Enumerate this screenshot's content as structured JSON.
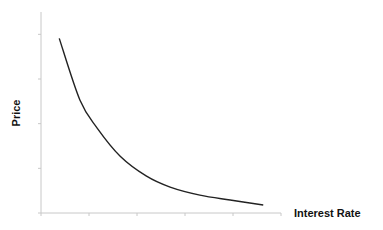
{
  "chart_data": {
    "type": "line",
    "title": "",
    "xlabel": "Interest Rate",
    "ylabel": "Price",
    "xlim": [
      0,
      5
    ],
    "ylim": [
      0,
      4.5
    ],
    "x_ticks": [
      0,
      1,
      2,
      3,
      4,
      5
    ],
    "y_ticks": [
      0,
      1,
      2,
      3,
      4
    ],
    "tick_labels_shown": false,
    "grid": false,
    "legend": "none",
    "series": [
      {
        "name": "Price vs Interest Rate",
        "color": "#222222",
        "x": [
          0.38,
          0.81,
          1.17,
          1.65,
          2.19,
          2.69,
          3.31,
          3.94,
          4.63
        ],
        "y": [
          3.91,
          2.53,
          1.9,
          1.27,
          0.83,
          0.58,
          0.4,
          0.29,
          0.18
        ]
      }
    ]
  }
}
